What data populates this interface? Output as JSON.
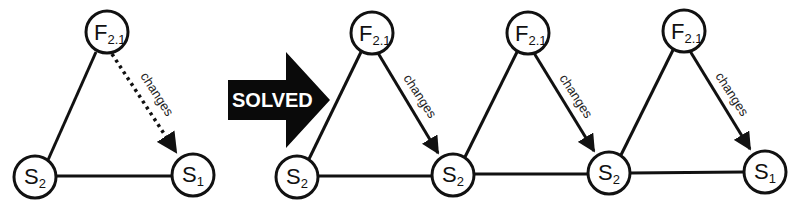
{
  "figure": {
    "colors": {
      "stroke": "#111111",
      "background": "#ffffff",
      "arrow_fill": "#0a0a0a",
      "arrow_text": "#ffffff"
    },
    "transition_arrow": {
      "label": "SOLVED"
    },
    "left_graph": {
      "nodes": [
        {
          "id": "F",
          "main": "F",
          "sub": "2.1"
        },
        {
          "id": "S2",
          "main": "S",
          "sub": "2"
        },
        {
          "id": "S1",
          "main": "S",
          "sub": "1"
        }
      ],
      "edges": [
        {
          "from": "F",
          "to": "S2",
          "style": "solid"
        },
        {
          "from": "S2",
          "to": "S1",
          "style": "solid"
        },
        {
          "from": "F",
          "to": "S1",
          "style": "dotted",
          "directed": true,
          "label": "changes"
        }
      ]
    },
    "right_graph": {
      "bottom_nodes": [
        {
          "main": "S",
          "sub": "2"
        },
        {
          "main": "S",
          "sub": "2"
        },
        {
          "main": "S",
          "sub": "2"
        },
        {
          "main": "S",
          "sub": "1"
        }
      ],
      "top_nodes": [
        {
          "main": "F",
          "sub": "2.1"
        },
        {
          "main": "F",
          "sub": "2.1"
        },
        {
          "main": "F",
          "sub": "2.1"
        }
      ],
      "edge_label": "changes"
    }
  }
}
